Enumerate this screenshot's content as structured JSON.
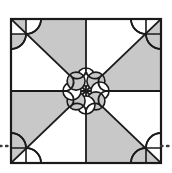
{
  "figure": {
    "title": "Geometric quilt-block tiling motif",
    "canvas": {
      "width": 172,
      "height": 173
    },
    "colors": {
      "shade": "#c8c8c8",
      "background": "#ffffff",
      "stroke": "#1a1a1a",
      "dotted": "#3a3a3a"
    },
    "square": {
      "x": 11,
      "y": 19,
      "width": 150,
      "height": 144,
      "stroke_width": 2
    },
    "center": {
      "cx": 86,
      "cy": 91
    },
    "rosette": {
      "petal_count": 8,
      "petal_radius": 14,
      "ring_radius": 17,
      "shaded_petals": 4,
      "label": "eight-petal rosette"
    },
    "corner_lobes": {
      "count": 4,
      "radius": 15,
      "label": "corner lobe pair"
    },
    "shaded_sectors": [
      "top-left-upper",
      "top-right-lower",
      "bottom-left-upper",
      "bottom-right-lower"
    ],
    "dotted_lines": {
      "y": 146,
      "left": {
        "x1": 0,
        "x2": 11
      },
      "right": {
        "x1": 161,
        "x2": 172
      },
      "dash": "2 4",
      "label": "pattern continuation dots"
    },
    "guides": {
      "midline_horizontal": "y = 91",
      "midline_vertical": "x = 86",
      "diagonal_main": "top-left to bottom-right",
      "diagonal_anti": "top-right to bottom-left"
    }
  }
}
